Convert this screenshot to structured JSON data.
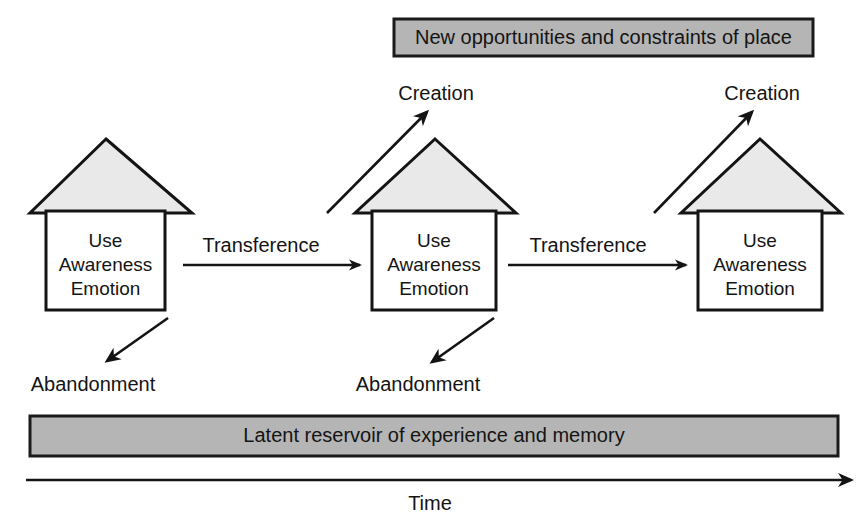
{
  "diagram": {
    "title_banner": {
      "label": "New opportunities and constraints of place",
      "fill": "#b5b5b5",
      "stroke": "#1a1a1a"
    },
    "reservoir_bar": {
      "label": "Latent reservoir of experience and memory",
      "fill": "#b5b5b5",
      "stroke": "#1a1a1a"
    },
    "time_axis": {
      "label": "Time"
    },
    "house_body_lines": [
      "Use",
      "Awareness",
      "Emotion"
    ],
    "roof_fill": "#e9e9e9",
    "line_color": "#141414",
    "houses": [
      {
        "id": "house-1",
        "lines": [
          "Use",
          "Awareness",
          "Emotion"
        ],
        "creation_label": null,
        "abandonment_label": "Abandonment"
      },
      {
        "id": "house-2",
        "lines": [
          "Use",
          "Awareness",
          "Emotion"
        ],
        "creation_label": "Creation",
        "abandonment_label": "Abandonment"
      },
      {
        "id": "house-3",
        "lines": [
          "Use",
          "Awareness",
          "Emotion"
        ],
        "creation_label": "Creation",
        "abandonment_label": null
      }
    ],
    "transference_arrows": [
      {
        "id": "transference-1",
        "label": "Transference"
      },
      {
        "id": "transference-2",
        "label": "Transference"
      }
    ]
  }
}
